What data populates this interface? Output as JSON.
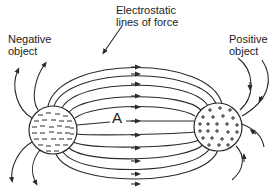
{
  "diagram": {
    "title_label": [
      "Electrostatic",
      "lines of force"
    ],
    "negative_label": [
      "Negative",
      "object"
    ],
    "positive_label": [
      "Positive",
      "object"
    ],
    "point_label": "A",
    "negative_object": {
      "charge_symbol": "−",
      "center": [
        53,
        130
      ],
      "radius": 24
    },
    "positive_object": {
      "charge_symbol": "+",
      "center": [
        218,
        127
      ],
      "radius": 24
    },
    "field_direction": "negative-to-positive arrows shown left-to-right",
    "colors": {
      "ink": "#2a2a2a",
      "background": "#ffffff"
    }
  }
}
